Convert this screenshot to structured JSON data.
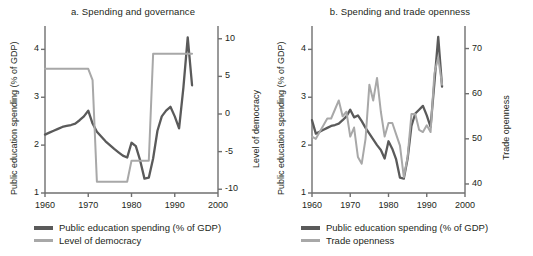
{
  "figure": {
    "background": "#ffffff",
    "series_colors": {
      "spending": "#5a5a5a",
      "secondary": "#a8a8a8"
    }
  },
  "panels": [
    {
      "id": "a",
      "title": "a. Spending and governance",
      "left_axis_label": "Public education spending (% of GDP)",
      "right_axis_label": "Level of democracy",
      "x_label": "",
      "x_ticks": [
        "1960",
        "1970",
        "1980",
        "1990",
        "2000"
      ],
      "y_left_ticks": [
        "1",
        "2",
        "3",
        "4"
      ],
      "y_right_ticks": [
        "-10",
        "-5",
        "0",
        "5",
        "10"
      ],
      "legend": [
        {
          "label": "Public education spending (% of GDP)",
          "color": "#5a5a5a"
        },
        {
          "label": "Level of democracy",
          "color": "#a8a8a8"
        }
      ]
    },
    {
      "id": "b",
      "title": "b. Spending and trade openness",
      "left_axis_label": "Public education spending (% of GDP)",
      "right_axis_label": "Trade openness",
      "x_label": "",
      "x_ticks": [
        "1960",
        "1970",
        "1980",
        "1990",
        "2000"
      ],
      "y_left_ticks": [
        "1",
        "2",
        "3",
        "4"
      ],
      "y_right_ticks": [
        "40",
        "50",
        "60",
        "70"
      ],
      "legend": [
        {
          "label": "Public education spending (% of GDP)",
          "color": "#5a5a5a"
        },
        {
          "label": "Trade openness",
          "color": "#a8a8a8"
        }
      ]
    }
  ],
  "chart_data": [
    {
      "type": "line",
      "panel": "a",
      "title": "a. Spending and governance",
      "xlabel": "",
      "ylabel": "Public education spending (% of GDP)",
      "y2label": "Level of democracy",
      "xlim": [
        1960,
        2000
      ],
      "ylim": [
        1,
        4.3
      ],
      "y2lim": [
        -10.5,
        10.5
      ],
      "grid": false,
      "legend_position": "below",
      "x": [
        1960,
        1961,
        1962,
        1963,
        1964,
        1965,
        1966,
        1967,
        1968,
        1969,
        1970,
        1971,
        1972,
        1973,
        1974,
        1975,
        1976,
        1977,
        1978,
        1979,
        1980,
        1981,
        1982,
        1983,
        1984,
        1985,
        1986,
        1987,
        1988,
        1989,
        1990,
        1991,
        1992,
        1993,
        1994
      ],
      "series": [
        {
          "name": "Public education spending (% of GDP)",
          "axis": "left",
          "color": "#5a5a5a",
          "values": [
            2.22,
            2.26,
            2.3,
            2.34,
            2.38,
            2.4,
            2.42,
            2.45,
            2.52,
            2.6,
            2.72,
            2.45,
            2.28,
            2.18,
            2.08,
            2.0,
            1.92,
            1.85,
            1.78,
            1.74,
            2.05,
            1.98,
            1.68,
            1.3,
            1.32,
            1.72,
            2.3,
            2.6,
            2.72,
            2.8,
            2.6,
            2.35,
            3.2,
            4.25,
            3.25
          ]
        },
        {
          "name": "Level of democracy",
          "axis": "right",
          "color": "#a8a8a8",
          "values": [
            6.0,
            6.0,
            6.0,
            6.0,
            6.0,
            6.0,
            6.0,
            6.0,
            6.0,
            6.0,
            6.0,
            4.5,
            -9.0,
            -9.0,
            -9.0,
            -9.0,
            -9.0,
            -9.0,
            -9.0,
            -9.0,
            -6.2,
            -6.2,
            -6.2,
            -6.2,
            -6.2,
            8.0,
            8.0,
            8.0,
            8.0,
            8.0,
            8.0,
            8.0,
            8.0,
            8.0,
            8.0
          ]
        }
      ]
    },
    {
      "type": "line",
      "panel": "b",
      "title": "b. Spending and trade openness",
      "xlabel": "",
      "ylabel": "Public education spending (% of GDP)",
      "y2label": "Trade openness",
      "xlim": [
        1960,
        2000
      ],
      "ylim": [
        1,
        4.3
      ],
      "y2lim": [
        38,
        73
      ],
      "grid": false,
      "legend_position": "below",
      "x": [
        1960,
        1961,
        1962,
        1963,
        1964,
        1965,
        1966,
        1967,
        1968,
        1969,
        1970,
        1971,
        1972,
        1973,
        1974,
        1975,
        1976,
        1977,
        1978,
        1979,
        1980,
        1981,
        1982,
        1983,
        1984,
        1985,
        1986,
        1987,
        1988,
        1989,
        1990,
        1991,
        1992,
        1993,
        1994
      ],
      "series": [
        {
          "name": "Public education spending (% of GDP)",
          "axis": "left",
          "color": "#5a5a5a",
          "values": [
            2.52,
            2.24,
            2.28,
            2.32,
            2.36,
            2.4,
            2.42,
            2.45,
            2.52,
            2.6,
            2.74,
            2.58,
            2.62,
            2.5,
            2.36,
            2.24,
            2.12,
            2.0,
            1.9,
            1.72,
            2.08,
            1.92,
            1.7,
            1.32,
            1.3,
            1.72,
            2.4,
            2.66,
            2.74,
            2.82,
            2.62,
            2.38,
            3.3,
            4.26,
            3.22
          ]
        },
        {
          "name": "Trade openness",
          "axis": "right",
          "color": "#a8a8a8",
          "values": [
            50.5,
            50.0,
            51.5,
            53.0,
            54.5,
            54.5,
            56.5,
            58.5,
            55.0,
            56.0,
            50.5,
            52.5,
            46.0,
            44.5,
            50.0,
            62.0,
            58.5,
            63.5,
            56.0,
            50.5,
            53.5,
            53.5,
            51.0,
            48.5,
            41.5,
            46.0,
            55.5,
            55.5,
            52.0,
            51.5,
            53.0,
            51.5,
            64.5,
            68.0,
            62.0
          ]
        }
      ]
    }
  ]
}
